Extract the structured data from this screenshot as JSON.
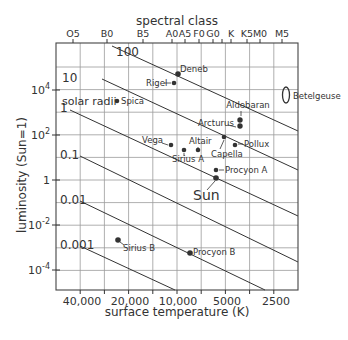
{
  "chart_data": {
    "type": "scatter",
    "title": "",
    "top_axis_title": "spectral class",
    "xlabel": "surface temperature (K)",
    "ylabel": "luminosity (Sun=1)",
    "x_scale": "log, reversed",
    "y_scale": "log",
    "xlim": [
      60000,
      2000
    ],
    "ylim": [
      1e-05,
      1000000
    ],
    "grid": true,
    "x_ticks": [
      {
        "label": "40,000",
        "value": 40000,
        "px": 82
      },
      {
        "label": "20,000",
        "value": 20000,
        "px": 130
      },
      {
        "label": "10,000",
        "value": 10000,
        "px": 178
      },
      {
        "label": "5000",
        "value": 5000,
        "px": 227
      },
      {
        "label": "2500",
        "value": 2500,
        "px": 276
      }
    ],
    "y_ticks": [
      {
        "label": "10",
        "sup": "4",
        "value": 10000,
        "px": 90
      },
      {
        "label": "10",
        "sup": "2",
        "value": 100,
        "px": 135
      },
      {
        "label": "1",
        "sup": "",
        "value": 1,
        "px": 180
      },
      {
        "label": "10",
        "sup": "-2",
        "value": 0.01,
        "px": 225
      },
      {
        "label": "10",
        "sup": "-4",
        "value": 0.0001,
        "px": 270
      }
    ],
    "spectral_ticks": [
      {
        "label": "O5",
        "px": 73
      },
      {
        "label": "B0",
        "px": 107
      },
      {
        "label": "B5",
        "px": 143
      },
      {
        "label": "A0",
        "px": 172
      },
      {
        "label": "A5",
        "px": 185
      },
      {
        "label": "F0",
        "px": 199
      },
      {
        "label": "G0",
        "px": 213
      },
      {
        "label": "",
        "px": 222
      },
      {
        "label": "K",
        "px": 231
      },
      {
        "label": "K5",
        "px": 247
      },
      {
        "label": "M0",
        "px": 260
      },
      {
        "label": "M5",
        "px": 282
      }
    ],
    "radius_lines": {
      "legend": "solar radii",
      "lines": [
        {
          "label": "100",
          "x1": 112,
          "y1": 46,
          "x2": 298,
          "y2": 131
        },
        {
          "label": "10",
          "x1": 102,
          "y1": 79,
          "x2": 298,
          "y2": 170
        },
        {
          "label": "1",
          "x1": 70,
          "y1": 110,
          "x2": 298,
          "y2": 216
        },
        {
          "label": "0.1",
          "x1": 80,
          "y1": 156,
          "x2": 298,
          "y2": 262
        },
        {
          "label": "0.01",
          "x1": 80,
          "y1": 201,
          "x2": 265,
          "y2": 290
        },
        {
          "label": "0.001",
          "x1": 80,
          "y1": 246,
          "x2": 175,
          "y2": 290
        }
      ]
    },
    "stars": [
      {
        "name": "Deneb",
        "temperature_K": 8500,
        "luminosity": 60000,
        "px": 178,
        "py": 74
      },
      {
        "name": "Rigel",
        "temperature_K": 11000,
        "luminosity": 40000,
        "px": 174,
        "py": 83
      },
      {
        "name": "Spica",
        "temperature_K": 22000,
        "luminosity": 12000,
        "px": 117,
        "py": 101
      },
      {
        "name": "Aldebaran",
        "temperature_K": 4000,
        "luminosity": 400,
        "px": 240,
        "py": 120
      },
      {
        "name": "Arcturus",
        "temperature_K": 4000,
        "luminosity": 170,
        "px": 240,
        "py": 126
      },
      {
        "name": "Vega",
        "temperature_K": 9600,
        "luminosity": 50,
        "px": 171,
        "py": 145
      },
      {
        "name": "Sirius A",
        "temperature_K": 9900,
        "luminosity": 25,
        "px": 184,
        "py": 150
      },
      {
        "name": "Altair",
        "temperature_K": 7700,
        "luminosity": 11,
        "px": 198,
        "py": 150
      },
      {
        "name": "Capella",
        "temperature_K": 5000,
        "luminosity": 80,
        "px": 224,
        "py": 137
      },
      {
        "name": "Pollux",
        "temperature_K": 4700,
        "luminosity": 40,
        "px": 235,
        "py": 145
      },
      {
        "name": "Procyon A",
        "temperature_K": 6500,
        "luminosity": 7,
        "px": 216,
        "py": 170
      },
      {
        "name": "Sun",
        "temperature_K": 5800,
        "luminosity": 1,
        "px": 216,
        "py": 178
      },
      {
        "name": "Sirius B",
        "temperature_K": 25000,
        "luminosity": 0.003,
        "px": 118,
        "py": 240
      },
      {
        "name": "Procyon B",
        "temperature_K": 7700,
        "luminosity": 0.0005,
        "px": 190,
        "py": 253
      },
      {
        "name": "Betelgeuse",
        "temperature_K": 3500,
        "luminosity": 100000,
        "px": 286,
        "py": 95,
        "shape": "ellipse"
      }
    ]
  }
}
